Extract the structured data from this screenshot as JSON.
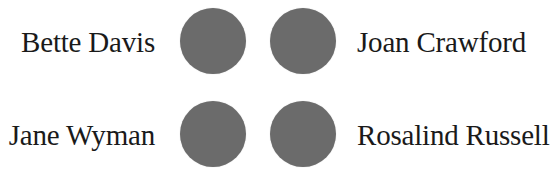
{
  "rows": [
    {
      "left_label": "Bette Davis",
      "right_label": "Joan Crawford"
    },
    {
      "left_label": "Jane Wyman",
      "right_label": "Rosalind Russell"
    }
  ],
  "colors": {
    "dot": "#6b6b6b",
    "text": "#1a1a1a",
    "background": "#ffffff"
  }
}
